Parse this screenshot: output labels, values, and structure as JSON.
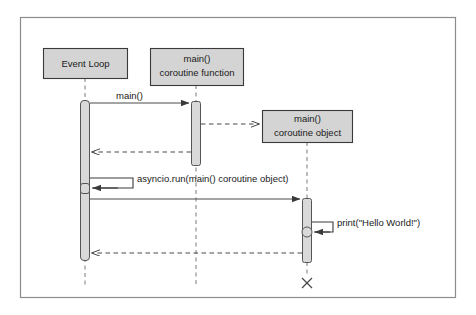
{
  "diagram": {
    "type": "uml-sequence-diagram",
    "title": "",
    "frame": {
      "x": 20,
      "y": 17,
      "width": 435,
      "height": 280,
      "border_color": "#8c8c8c",
      "background": "#ffffff"
    },
    "style": {
      "box_fill": "#d4d4d4",
      "box_stroke": "#3a3a3a",
      "activation_fill": "#d9d9d9",
      "activation_stroke": "#555555",
      "line_color": "#4a4a4a",
      "text_color": "#1a1a1a",
      "lifeline_dash_color": "#7a7a7a"
    },
    "participants": [
      {
        "id": "event-loop",
        "lines": [
          "Event Loop"
        ],
        "box": {
          "x": 43,
          "y": 48,
          "width": 84,
          "height": 30
        },
        "lifeline_x": 85,
        "lifeline_top": 78,
        "lifeline_bottom": 285
      },
      {
        "id": "main-coroutine-function",
        "lines": [
          "main()",
          "coroutine function"
        ],
        "box": {
          "x": 150,
          "y": 48,
          "width": 93,
          "height": 37
        },
        "lifeline_x": 196,
        "lifeline_top": 85,
        "lifeline_bottom": 285
      },
      {
        "id": "main-coroutine-object",
        "lines": [
          "main()",
          "coroutine object"
        ],
        "box": {
          "x": 262,
          "y": 110,
          "width": 90,
          "height": 32
        },
        "lifeline_x": 307,
        "lifeline_top": 142,
        "lifeline_bottom": 276
      }
    ],
    "activations": [
      {
        "id": "event-loop-activation",
        "x": 80,
        "y": 100,
        "width": 10,
        "height": 160
      },
      {
        "id": "coroutine-function-activation",
        "x": 191,
        "y": 101,
        "width": 10,
        "height": 64
      },
      {
        "id": "coroutine-object-activation",
        "x": 302,
        "y": 198,
        "width": 10,
        "height": 64
      }
    ],
    "messages": [
      {
        "id": "call-main",
        "label": "main()",
        "kind": "call",
        "style": "solid",
        "from_x": 90,
        "to_x": 191,
        "y": 103,
        "label_x": 118,
        "label_y": 98
      },
      {
        "id": "return-coroutine-object",
        "label": "",
        "kind": "create-return",
        "style": "dashed",
        "from_x": 201,
        "to_x": 261,
        "y": 124
      },
      {
        "id": "return-to-event-loop",
        "label": "",
        "kind": "return",
        "style": "dashed",
        "from_x": 191,
        "to_x": 91,
        "y": 152
      },
      {
        "id": "call-asyncio-run",
        "label": "asyncio.run(main() coroutine object)",
        "kind": "self-call",
        "style": "solid",
        "marker_x": 85,
        "marker_y": 188,
        "bracket_right_x": 133,
        "bracket_top_y": 178,
        "label_x": 137,
        "label_y": 182
      },
      {
        "id": "call-run-coroutine",
        "label": "",
        "kind": "call",
        "style": "solid",
        "from_x": 90,
        "to_x": 302,
        "y": 199
      },
      {
        "id": "call-print-hello-world",
        "label": "print(\"Hello World!\")",
        "kind": "self-call",
        "style": "solid",
        "marker_x": 307,
        "marker_y": 232,
        "bracket_right_x": 333,
        "bracket_top_y": 222,
        "label_x": 337,
        "label_y": 226
      },
      {
        "id": "return-result-to-event-loop",
        "label": "",
        "kind": "return",
        "style": "dashed",
        "from_x": 302,
        "to_x": 91,
        "y": 253
      }
    ],
    "terminators": [
      {
        "id": "coroutine-object-destroy",
        "x": 307,
        "y": 283,
        "size": 6
      }
    ]
  }
}
